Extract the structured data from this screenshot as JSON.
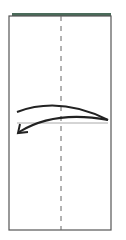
{
  "diagram": {
    "type": "origami-fold-step",
    "paper": {
      "color": "#ffffff",
      "edge_color": "#555555",
      "top_strip_color": "#4a6b5a"
    },
    "fold_line": {
      "style": "dashed",
      "orientation": "vertical",
      "color": "#666666"
    },
    "crease_line": {
      "orientation": "horizontal",
      "color": "#aaaaaa"
    },
    "arrow": {
      "direction": "right-to-left",
      "color": "#222222",
      "meaning": "fold"
    }
  }
}
